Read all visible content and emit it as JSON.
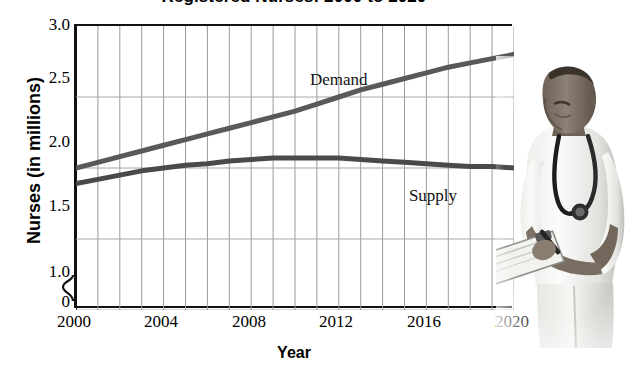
{
  "chart_data": {
    "type": "line",
    "title": "Registered Nurses: 2000 to 2020",
    "xlabel": "Year",
    "ylabel": "Nurses (in millions)",
    "xlim": [
      2000,
      2020
    ],
    "ylim": [
      1.0,
      3.0
    ],
    "y_axis_break": true,
    "y_axis_zero_label": "0",
    "grid": true,
    "legend_position": "inline-labels",
    "xticks": [
      2000,
      2004,
      2008,
      2012,
      2016,
      2020
    ],
    "xtick_labels": [
      "2000",
      "2004",
      "2008",
      "2012",
      "2016",
      "2020"
    ],
    "yticks": [
      1.0,
      1.5,
      2.0,
      2.5,
      3.0
    ],
    "ytick_labels": [
      "1.0",
      "1.5",
      "2.0",
      "2.5",
      "3.0"
    ],
    "x": [
      2000,
      2001,
      2002,
      2003,
      2004,
      2005,
      2006,
      2007,
      2008,
      2009,
      2010,
      2011,
      2012,
      2013,
      2014,
      2015,
      2016,
      2017,
      2018,
      2019,
      2020
    ],
    "series": [
      {
        "name": "Demand",
        "label": "Demand",
        "color": "#595959",
        "values": [
          2.0,
          2.04,
          2.08,
          2.12,
          2.16,
          2.2,
          2.24,
          2.28,
          2.32,
          2.36,
          2.4,
          2.45,
          2.5,
          2.55,
          2.59,
          2.63,
          2.67,
          2.71,
          2.74,
          2.77,
          2.8
        ]
      },
      {
        "name": "Supply",
        "label": "Supply",
        "color": "#4a4a4a",
        "values": [
          1.89,
          1.92,
          1.95,
          1.98,
          2.0,
          2.02,
          2.03,
          2.05,
          2.06,
          2.07,
          2.07,
          2.07,
          2.07,
          2.06,
          2.05,
          2.04,
          2.03,
          2.02,
          2.01,
          2.01,
          2.0
        ]
      }
    ],
    "annotations": [
      {
        "text": "Demand",
        "x": 2012.0,
        "y": 2.62
      },
      {
        "text": "Supply",
        "x": 2016.3,
        "y": 1.8
      }
    ]
  },
  "photo": {
    "name": "male-nurse-with-clipboard-photo",
    "description": "Grayscale photograph of a male nurse in white scrubs wearing a stethoscope, writing on a clipboard"
  }
}
